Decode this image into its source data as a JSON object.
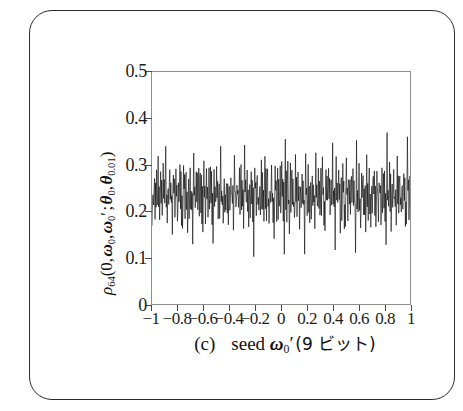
{
  "figure": {
    "panel_label": "(c)",
    "caption_seed_word": "seed",
    "caption_symbol_base": "ω",
    "caption_symbol_sub": "0",
    "caption_symbol_prime": "′",
    "caption_tail": "(9 ビット)",
    "caption_full": "(c)   seed ω0′ (9 ビット)",
    "border_color": "#2b2b2b",
    "background_color": "#ffffff"
  },
  "chart_data": {
    "type": "line",
    "title": "",
    "subtitle": "",
    "xlabel": "(c)   seed ω0′ (9 ビット)",
    "ylabel": "ρ64(0, ω0, ω0′ ; θ0, θ0.01)",
    "ylabel_parts": {
      "rho": "ρ",
      "rho_sub": "64",
      "arg_zero": "0",
      "omega": "ω",
      "omega_sub": "0",
      "omega_prime": "′",
      "theta": "θ",
      "theta_sub_1": "0",
      "theta_sub_2": "0.01"
    },
    "xlim": [
      -1,
      1
    ],
    "ylim": [
      0,
      0.5
    ],
    "xticks": [
      -1,
      -0.8,
      -0.6,
      -0.4,
      -0.2,
      0,
      0.2,
      0.4,
      0.6,
      0.8,
      1
    ],
    "xticklabels": [
      "−1",
      "−0.8",
      "−0.6",
      "−0.4",
      "−0.2",
      "0",
      "0.2",
      "0.4",
      "0.6",
      "0.8",
      "1"
    ],
    "yticks": [
      0,
      0.1,
      0.2,
      0.3,
      0.4,
      0.5
    ],
    "yticklabels": [
      "0",
      "0.1",
      "0.2",
      "0.3",
      "0.4",
      "0.5"
    ],
    "grid": false,
    "legend": null,
    "line_color": "#000000",
    "line_width": 0.6,
    "series": [
      {
        "name": "rho_64",
        "description": "dense noisy trace, mean ~0.245, spread ~0.11 to 0.38",
        "mean": 0.245,
        "min": 0.105,
        "max": 0.382,
        "n_points": 512,
        "values": [
          0.163,
          0.215,
          0.258,
          0.196,
          0.241,
          0.288,
          0.205,
          0.252,
          0.222,
          0.276,
          0.189,
          0.247,
          0.301,
          0.218,
          0.262,
          0.197,
          0.239,
          0.284,
          0.211,
          0.255,
          0.176,
          0.233,
          0.295,
          0.224,
          0.268,
          0.203,
          0.246,
          0.335,
          0.214,
          0.259,
          0.185,
          0.228,
          0.272,
          0.207,
          0.251,
          0.292,
          0.219,
          0.263,
          0.198,
          0.243,
          0.168,
          0.236,
          0.305,
          0.227,
          0.265,
          0.201,
          0.248,
          0.283,
          0.216,
          0.257,
          0.192,
          0.231,
          0.274,
          0.209,
          0.253,
          0.298,
          0.222,
          0.266,
          0.195,
          0.24,
          0.173,
          0.234,
          0.313,
          0.225,
          0.261,
          0.204,
          0.249,
          0.287,
          0.213,
          0.256,
          0.181,
          0.229,
          0.279,
          0.206,
          0.25,
          0.294,
          0.22,
          0.264,
          0.199,
          0.244,
          0.157,
          0.237,
          0.308,
          0.226,
          0.269,
          0.202,
          0.245,
          0.289,
          0.217,
          0.258,
          0.187,
          0.232,
          0.277,
          0.208,
          0.254,
          0.296,
          0.221,
          0.267,
          0.194,
          0.242,
          0.166,
          0.235,
          0.322,
          0.223,
          0.26,
          0.2,
          0.247,
          0.285,
          0.215,
          0.253,
          0.178,
          0.23,
          0.273,
          0.21,
          0.249,
          0.291,
          0.218,
          0.262,
          0.196,
          0.238,
          0.148,
          0.233,
          0.302,
          0.228,
          0.266,
          0.205,
          0.244,
          0.28,
          0.212,
          0.255,
          0.183,
          0.227,
          0.271,
          0.207,
          0.252,
          0.345,
          0.223,
          0.265,
          0.193,
          0.241,
          0.171,
          0.236,
          0.299,
          0.224,
          0.259,
          0.199,
          0.246,
          0.286,
          0.214,
          0.251,
          0.19,
          0.231,
          0.275,
          0.211,
          0.248,
          0.293,
          0.219,
          0.263,
          0.197,
          0.243,
          0.135,
          0.238,
          0.31,
          0.229,
          0.268,
          0.203,
          0.245,
          0.282,
          0.216,
          0.257,
          0.184,
          0.226,
          0.27,
          0.206,
          0.25,
          0.29,
          0.222,
          0.261,
          0.192,
          0.239,
          0.174,
          0.234,
          0.328,
          0.225,
          0.264,
          0.201,
          0.247,
          0.288,
          0.213,
          0.254,
          0.179,
          0.232,
          0.276,
          0.209,
          0.251,
          0.297,
          0.22,
          0.266,
          0.198,
          0.24,
          0.11,
          0.237,
          0.304,
          0.227,
          0.262,
          0.202,
          0.243,
          0.284,
          0.217,
          0.256,
          0.186,
          0.228,
          0.278,
          0.208,
          0.253,
          0.295,
          0.221,
          0.26,
          0.195,
          0.242,
          0.169,
          0.235,
          0.317,
          0.226,
          0.267,
          0.204,
          0.248,
          0.281,
          0.215,
          0.252,
          0.182,
          0.23,
          0.272,
          0.21,
          0.249,
          0.292,
          0.218,
          0.265,
          0.191,
          0.237,
          0.16,
          0.239,
          0.306,
          0.224,
          0.258,
          0.2,
          0.246,
          0.287,
          0.212,
          0.255,
          0.188,
          0.233,
          0.274,
          0.207,
          0.254,
          0.299,
          0.223,
          0.268,
          0.199,
          0.245,
          0.125,
          0.236,
          0.331,
          0.228,
          0.263,
          0.205,
          0.244,
          0.283,
          0.214,
          0.25,
          0.177,
          0.229,
          0.279,
          0.211,
          0.252,
          0.294,
          0.219,
          0.259,
          0.196,
          0.241,
          0.164,
          0.234,
          0.3,
          0.225,
          0.269,
          0.203,
          0.247,
          0.285,
          0.216,
          0.253,
          0.191,
          0.231,
          0.271,
          0.206,
          0.248,
          0.291,
          0.222,
          0.264,
          0.194,
          0.244,
          0.112,
          0.238,
          0.352,
          0.227,
          0.261,
          0.201,
          0.245,
          0.289,
          0.213,
          0.257,
          0.18,
          0.232,
          0.277,
          0.209,
          0.255,
          0.296,
          0.22,
          0.262,
          0.197,
          0.239,
          0.172,
          0.235,
          0.311,
          0.223,
          0.266,
          0.204,
          0.243,
          0.28,
          0.217,
          0.251,
          0.185,
          0.23,
          0.273,
          0.208,
          0.25,
          0.293,
          0.221,
          0.267,
          0.193,
          0.246,
          0.155,
          0.237,
          0.297,
          0.229,
          0.26,
          0.199,
          0.249,
          0.286,
          0.211,
          0.258,
          0.189,
          0.233,
          0.275,
          0.21,
          0.251,
          0.372,
          0.224,
          0.263,
          0.198,
          0.24,
          0.141,
          0.236,
          0.32,
          0.226,
          0.265,
          0.202,
          0.246,
          0.282,
          0.215,
          0.254,
          0.175,
          0.228,
          0.27,
          0.207,
          0.253,
          0.29,
          0.218,
          0.261,
          0.192,
          0.243,
          0.167,
          0.239,
          0.303,
          0.225,
          0.268,
          0.205,
          0.247,
          0.288,
          0.214,
          0.256,
          0.183,
          0.231,
          0.278,
          0.212,
          0.249,
          0.298,
          0.223,
          0.266,
          0.196,
          0.242,
          0.13,
          0.234,
          0.338,
          0.227,
          0.259,
          0.2,
          0.244,
          0.284,
          0.216,
          0.252,
          0.193,
          0.229,
          0.272,
          0.206,
          0.255,
          0.292,
          0.219,
          0.26,
          0.195,
          0.238,
          0.17,
          0.237,
          0.309,
          0.224,
          0.264,
          0.203,
          0.248,
          0.287,
          0.213,
          0.257,
          0.181,
          0.232,
          0.276,
          0.209,
          0.251,
          0.295,
          0.222,
          0.268,
          0.199,
          0.245,
          0.159,
          0.235,
          0.315,
          0.228,
          0.262,
          0.201,
          0.245,
          0.281,
          0.217,
          0.25,
          0.187,
          0.23,
          0.274,
          0.211,
          0.254,
          0.299,
          0.22,
          0.265,
          0.194,
          0.241,
          0.146,
          0.238,
          0.362,
          0.226,
          0.267,
          0.204,
          0.243,
          0.285,
          0.212,
          0.256,
          0.178,
          0.233,
          0.271,
          0.208,
          0.248,
          0.289,
          0.221,
          0.259,
          0.197,
          0.244,
          0.165,
          0.236,
          0.305,
          0.225,
          0.263,
          0.202,
          0.249,
          0.286,
          0.215,
          0.253,
          0.19,
          0.231,
          0.279,
          0.21,
          0.252,
          0.294,
          0.218,
          0.264,
          0.191,
          0.239,
          0.152,
          0.234,
          0.348,
          0.229,
          0.266,
          0.205,
          0.246,
          0.283,
          0.214,
          0.255,
          0.184,
          0.227,
          0.273,
          0.207
        ]
      }
    ]
  }
}
